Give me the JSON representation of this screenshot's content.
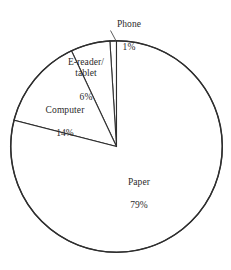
{
  "chart_data": {
    "type": "pie",
    "title": "",
    "subtitle": "",
    "xlabel": "",
    "ylabel": "",
    "legend_position": "none",
    "grid": false,
    "units": "percent",
    "total": 100,
    "start_angle_deg": 90,
    "direction": "counterclockwise",
    "categories": [
      "Phone",
      "E-reader/\ntablet",
      "Computer",
      "Paper"
    ],
    "values": [
      1,
      6,
      14,
      79
    ],
    "slices": [
      {
        "name": "Phone",
        "label": "Phone",
        "value": 1,
        "value_label": "1%",
        "color": "#ffffff",
        "outline_color": "#333333",
        "label_placement": "outside-top",
        "has_leader_line": true
      },
      {
        "name": "E-reader/tablet",
        "label": "E-reader/\ntablet",
        "value": 6,
        "value_label": "6%",
        "color": "#ffffff",
        "outline_color": "#333333",
        "label_placement": "inside",
        "has_leader_line": false
      },
      {
        "name": "Computer",
        "label": "Computer",
        "value": 14,
        "value_label": "14%",
        "color": "#ffffff",
        "outline_color": "#333333",
        "label_placement": "inside",
        "has_leader_line": false
      },
      {
        "name": "Paper",
        "label": "Paper",
        "value": 79,
        "value_label": "79%",
        "color": "#ffffff",
        "outline_color": "#2e2e2e",
        "label_placement": "inside",
        "has_leader_line": false
      }
    ]
  },
  "labels": {
    "phone": {
      "name": "Phone",
      "value": "1%"
    },
    "ereader": {
      "name": "E-reader/\ntablet",
      "value": "6%"
    },
    "computer": {
      "name": "Computer",
      "value": "14%"
    },
    "paper": {
      "name": "Paper",
      "value": "79%"
    }
  }
}
